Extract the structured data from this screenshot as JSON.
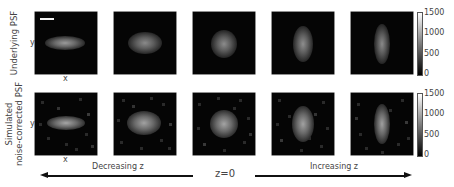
{
  "figure": {
    "rows": [
      {
        "label": "Underlying PSF",
        "y_axis_label": "y",
        "x_axis_label": "x",
        "panels": [
          {
            "z_index": -2,
            "shape": "horizontal-elongated",
            "noise": false
          },
          {
            "z_index": -1,
            "shape": "slightly-horizontal",
            "noise": false
          },
          {
            "z_index": 0,
            "shape": "round",
            "noise": false
          },
          {
            "z_index": 1,
            "shape": "slightly-vertical",
            "noise": false
          },
          {
            "z_index": 2,
            "shape": "vertical-elongated",
            "noise": false
          }
        ],
        "colorbar": {
          "ticks": [
            "1500",
            "1000",
            "500",
            "0"
          ],
          "min": 0,
          "max": 1500
        }
      },
      {
        "label_line1": "Simulated",
        "label_line2": "noise-corrected PSF",
        "y_axis_label": "y",
        "x_axis_label": "x",
        "panels": [
          {
            "z_index": -2,
            "shape": "horizontal-elongated",
            "noise": true
          },
          {
            "z_index": -1,
            "shape": "slightly-horizontal",
            "noise": true
          },
          {
            "z_index": 0,
            "shape": "round",
            "noise": true
          },
          {
            "z_index": 1,
            "shape": "slightly-vertical",
            "noise": true
          },
          {
            "z_index": 2,
            "shape": "vertical-elongated",
            "noise": true
          }
        ],
        "colorbar": {
          "ticks": [
            "1500",
            "1000",
            "500",
            "0"
          ],
          "min": 0,
          "max": 1500
        }
      }
    ],
    "bottom_axis": {
      "left_caption": "Decreasing z",
      "center_label": "z=0",
      "right_caption": "Increasing z"
    },
    "colormap": "gray"
  }
}
